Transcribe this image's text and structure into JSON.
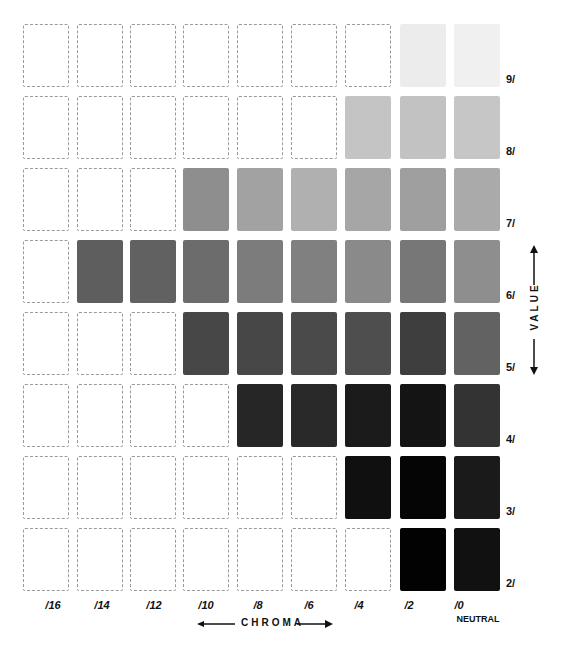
{
  "chart_data": {
    "type": "table",
    "xlabel": "CHROMA",
    "ylabel": "VALUE",
    "columns": [
      "/16",
      "/14",
      "/12",
      "/10",
      "/8",
      "/6",
      "/4",
      "/2",
      "/0"
    ],
    "neutral_label": "NEUTRAL",
    "rows": [
      "9/",
      "8/",
      "7/",
      "6/",
      "5/",
      "4/",
      "3/",
      "2/"
    ],
    "cells": [
      [
        "",
        "",
        "",
        "",
        "",
        "",
        "",
        "#ececec",
        "#f0f0f0"
      ],
      [
        "",
        "",
        "",
        "",
        "",
        "",
        "#c4c4c4",
        "#c2c2c2",
        "#c6c6c6"
      ],
      [
        "",
        "",
        "",
        "#8e8e8e",
        "#a2a2a2",
        "#b0b0b0",
        "#a6a6a6",
        "#9f9f9f",
        "#aaaaaa"
      ],
      [
        "",
        "#5e5e5e",
        "#616161",
        "#6c6c6c",
        "#7c7c7c",
        "#808080",
        "#8a8a8a",
        "#777777",
        "#8e8e8e"
      ],
      [
        "",
        "",
        "",
        "#474747",
        "#474747",
        "#4a4a4a",
        "#4e4e4e",
        "#3e3e3e",
        "#626262"
      ],
      [
        "",
        "",
        "",
        "",
        "#262626",
        "#292929",
        "#1b1b1b",
        "#141414",
        "#333333"
      ],
      [
        "",
        "",
        "",
        "",
        "",
        "",
        "#101010",
        "#050505",
        "#1a1a1a"
      ],
      [
        "",
        "",
        "",
        "",
        "",
        "",
        "",
        "#020202",
        "#111111"
      ]
    ]
  },
  "labels": {
    "rows": [
      "9/",
      "8/",
      "7/",
      "6/",
      "5/",
      "4/",
      "3/",
      "2/"
    ],
    "columns": [
      "/16",
      "/14",
      "/12",
      "/10",
      "/8",
      "/6",
      "/4",
      "/2",
      "/0"
    ],
    "neutral": "NEUTRAL",
    "chroma": "CHROMA",
    "value": "VALUE"
  }
}
